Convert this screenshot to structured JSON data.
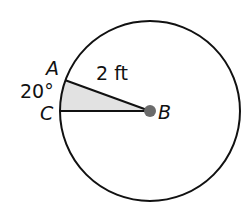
{
  "diagram": {
    "points": {
      "A": {
        "label": "A"
      },
      "B": {
        "label": "B"
      },
      "C": {
        "label": "C"
      }
    },
    "radius_label": "2 ft",
    "angle_label": "20°",
    "colors": {
      "sector_fill": "#e2e2e2",
      "center_dot": "#6b6b6b",
      "stroke": "#111111"
    }
  }
}
